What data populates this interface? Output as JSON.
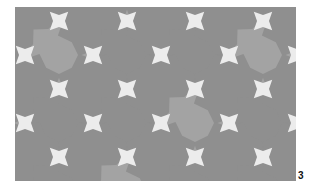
{
  "figure": {
    "label": "3",
    "colors": {
      "background": "#ececec",
      "tile": "#8f8f8f",
      "tile_light": "#a3a3a3",
      "page": "#ffffff"
    }
  }
}
